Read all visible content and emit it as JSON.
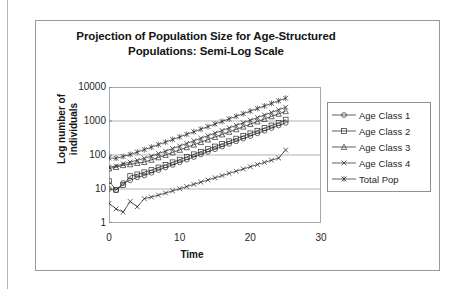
{
  "chart_data": {
    "type": "line",
    "title": "Projection of Population Size for Age-Structured Populations: Semi-Log Scale",
    "title_line1": "Projection of Population Size for Age-Structured",
    "title_line2": "Populations: Semi-Log Scale",
    "xlabel": "Time",
    "ylabel": "Log number of individuals",
    "ylabel_line1": "Log number of",
    "ylabel_line2": "individuals",
    "yscale": "log",
    "ylim": [
      1,
      10000
    ],
    "xlim": [
      0,
      30
    ],
    "yticks": [
      "1",
      "10",
      "100",
      "1000",
      "10000"
    ],
    "ytick_values": [
      1,
      10,
      100,
      1000,
      10000
    ],
    "xticks": [
      "0",
      "10",
      "20",
      "30"
    ],
    "xtick_values": [
      0,
      10,
      20,
      30
    ],
    "grid": "horizontal",
    "legend_position": "right",
    "x": [
      0,
      1,
      2,
      3,
      4,
      5,
      6,
      7,
      8,
      9,
      10,
      11,
      12,
      13,
      14,
      15,
      16,
      17,
      18,
      19,
      20,
      21,
      22,
      23,
      24,
      25
    ],
    "series": [
      {
        "name": "Age Class 1",
        "marker": "circle",
        "values": [
          10,
          9.2,
          15,
          18,
          22,
          25,
          30,
          36,
          43,
          51,
          61,
          73,
          87,
          104,
          124,
          148,
          177,
          212,
          253,
          302,
          361,
          432,
          516,
          617,
          737,
          880
        ]
      },
      {
        "name": "Age Class 2",
        "marker": "square",
        "values": [
          17,
          9.5,
          13,
          24,
          27,
          31,
          36,
          43,
          51,
          61,
          73,
          88,
          105,
          125,
          149,
          178,
          213,
          254,
          304,
          363,
          434,
          518,
          620,
          740,
          884,
          1100
        ]
      },
      {
        "name": "Age Class 3",
        "marker": "triangle",
        "values": [
          40,
          44,
          50,
          53,
          58,
          62,
          72,
          85,
          100,
          119,
          141,
          168,
          200,
          238,
          283,
          337,
          401,
          478,
          569,
          678,
          807,
          961,
          1145,
          1363,
          1623,
          1933
        ]
      },
      {
        "name": "Age Class 4",
        "marker": "cross",
        "values": [
          44,
          47,
          55,
          62,
          70,
          80,
          93,
          110,
          130,
          155,
          184,
          219,
          261,
          311,
          370,
          441,
          525,
          626,
          745,
          888,
          1058,
          1260,
          1501,
          1788,
          2130,
          2537
        ]
      },
      {
        "name": "Total Pop",
        "marker": "star",
        "values": [
          82,
          80,
          90,
          104,
          122,
          144,
          170,
          202,
          240,
          286,
          340,
          405,
          482,
          574,
          684,
          815,
          970,
          1156,
          1376,
          1639,
          1952,
          2325,
          2769,
          3298,
          3928,
          4678
        ]
      },
      {
        "name": "Lower Cohort",
        "marker": "cross",
        "values": [
          3.8,
          2.6,
          2.1,
          4.3,
          3.0,
          5.2,
          5.8,
          6.6,
          7.6,
          8.8,
          10.2,
          11.8,
          13.7,
          15.9,
          18.4,
          21.4,
          24.8,
          28.8,
          33.4,
          38.8,
          45,
          52.2,
          60.6,
          70.3,
          81.6,
          140
        ]
      }
    ],
    "legend_entries": [
      {
        "label": "Age Class 1",
        "marker": "circle"
      },
      {
        "label": "Age Class 2",
        "marker": "square"
      },
      {
        "label": "Age Class 3",
        "marker": "triangle"
      },
      {
        "label": "Age Class 4",
        "marker": "cross"
      },
      {
        "label": "Total Pop",
        "marker": "star"
      }
    ],
    "colors": {
      "line": "#2b2b2b",
      "grid": "#9e9e9e",
      "axis": "#6f6f6f",
      "text": "#141414",
      "background": "#ffffff"
    }
  }
}
